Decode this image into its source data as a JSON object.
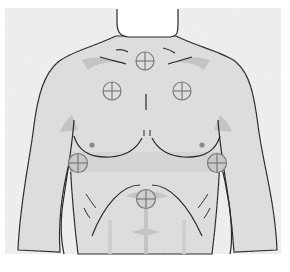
{
  "diagram": {
    "description": "Electrode placement diagram on anterior torso",
    "colors": {
      "background": "#ffffff",
      "panel": "#ebebeb",
      "skin": "#dcdcdc",
      "shadow": "#c4c4c4",
      "outline": "#2a2a2a",
      "marker_stroke": "#7a7a7a",
      "marker_fill": "#c8c8c8",
      "neck": "#ffffff",
      "nipple": "#8a8a8a"
    },
    "electrodes": [
      {
        "id": "upper-sternum",
        "x": 145,
        "y": 61,
        "r": 9
      },
      {
        "id": "right-infraclavicular",
        "x": 112,
        "y": 91,
        "r": 9
      },
      {
        "id": "left-infraclavicular",
        "x": 182,
        "y": 91,
        "r": 9
      },
      {
        "id": "right-midaxillary",
        "x": 78,
        "y": 163,
        "r": 9
      },
      {
        "id": "left-midaxillary",
        "x": 217,
        "y": 163,
        "r": 9
      },
      {
        "id": "epigastric",
        "x": 146,
        "y": 199,
        "r": 9
      }
    ]
  }
}
